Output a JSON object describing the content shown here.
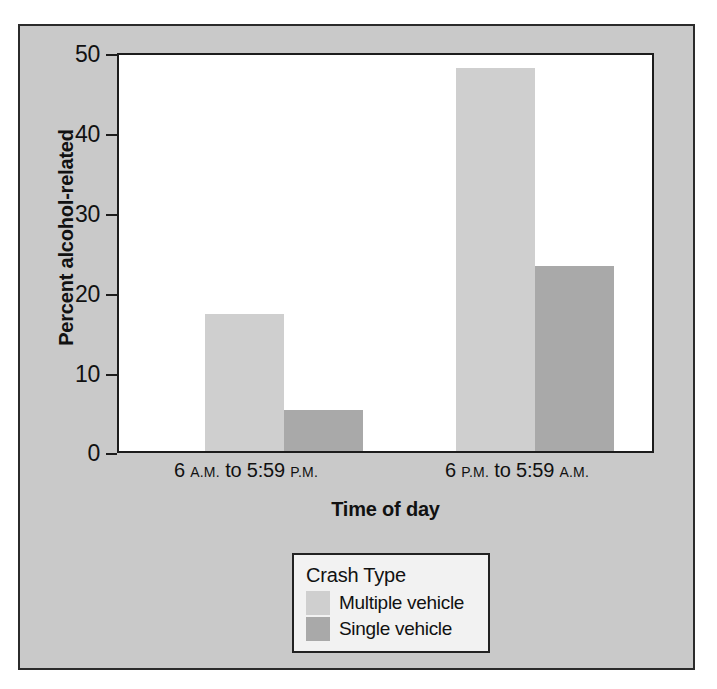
{
  "chart_data": {
    "type": "bar",
    "title": "",
    "xlabel": "Time of day",
    "ylabel": "Percent alcohol-related",
    "categories": [
      "6 A.M. to 5:59 P.M.",
      "6 P.M. to 5:59 A.M."
    ],
    "categories_parts": [
      {
        "num1": "6",
        "ampm1": "A.M.",
        "mid": "to 5:59",
        "ampm2": "P.M."
      },
      {
        "num1": "6",
        "ampm1": "P.M.",
        "mid": "to 5:59",
        "ampm2": "A.M."
      }
    ],
    "series": [
      {
        "name": "Multiple vehicle",
        "color": "#cfcfcf",
        "values": [
          17.3,
          48.3
        ]
      },
      {
        "name": "Single vehicle",
        "color": "#a9a9a9",
        "values": [
          5.2,
          23.4
        ]
      }
    ],
    "ylim": [
      0,
      50
    ],
    "yticks": [
      0,
      10,
      20,
      30,
      40,
      50
    ],
    "ytick_labels": [
      "0",
      "10",
      "20",
      "30",
      "40",
      "50"
    ],
    "grid": false,
    "legend_position": "below-plot-center",
    "legend_title": "Crash Type"
  },
  "figure": {
    "background_color": "#c9c9c9",
    "plot_background_color": "#ffffff",
    "frame_color": "#2b2b2b",
    "axis_color": "#1c1c1c",
    "text_color": "#111111"
  }
}
